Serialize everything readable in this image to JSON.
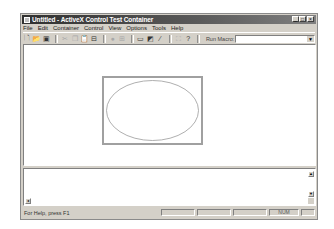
{
  "window": {
    "title": "Untitled - ActiveX Control Test Container",
    "buttons": {
      "minimize": "_",
      "maximize": "□",
      "close": "×"
    }
  },
  "menubar": {
    "items": [
      "File",
      "Edit",
      "Container",
      "Control",
      "View",
      "Options",
      "Tools",
      "Help"
    ]
  },
  "toolbar": {
    "icons": [
      {
        "name": "new-icon",
        "glyph": "🗋",
        "enabled": true
      },
      {
        "name": "open-icon",
        "glyph": "📂",
        "enabled": true
      },
      {
        "name": "save-icon",
        "glyph": "▣",
        "enabled": true
      },
      {
        "name": "cut-icon",
        "glyph": "✂",
        "enabled": false
      },
      {
        "name": "copy-icon",
        "glyph": "❐",
        "enabled": false
      },
      {
        "name": "paste-icon",
        "glyph": "📋",
        "enabled": false
      },
      {
        "name": "insert-control-icon",
        "glyph": "⊟",
        "enabled": true
      },
      {
        "name": "invoke-methods-icon",
        "glyph": "●",
        "enabled": false
      },
      {
        "name": "properties-icon",
        "glyph": "⊞",
        "enabled": false
      },
      {
        "name": "control-window-icon",
        "glyph": "▭",
        "enabled": true
      },
      {
        "name": "design-mode-icon",
        "glyph": "◩",
        "enabled": true
      },
      {
        "name": "run-mode-icon",
        "glyph": "⁄",
        "enabled": true
      },
      {
        "name": "select-icon",
        "glyph": "⛶",
        "enabled": false
      },
      {
        "name": "help-icon",
        "glyph": "?",
        "enabled": true
      }
    ],
    "run_macro_label": "Run Macro:",
    "run_macro_value": ""
  },
  "output_pane": {
    "text": ""
  },
  "statusbar": {
    "help_text": "For Help, press F1",
    "panes": [
      "",
      "",
      "",
      "NUM",
      ""
    ]
  },
  "colors": {
    "face": "#d4d0c8",
    "titlebar": "#303030",
    "client": "#ffffff"
  }
}
